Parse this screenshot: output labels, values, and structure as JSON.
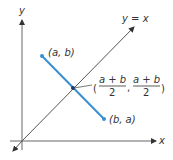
{
  "axes": {
    "x_label": "x",
    "y_label": "y"
  },
  "line": {
    "label": "y = x"
  },
  "points": {
    "p1": {
      "label": "(a, b)"
    },
    "p2": {
      "label": "(b, a)"
    }
  },
  "midpoint": {
    "num1": "a + b",
    "den1": "2",
    "num2": "a + b",
    "den2": "2",
    "open": "(",
    "comma": ",",
    "close": ")"
  },
  "colors": {
    "segment": "#3a8fd0",
    "axes": "#555555"
  }
}
